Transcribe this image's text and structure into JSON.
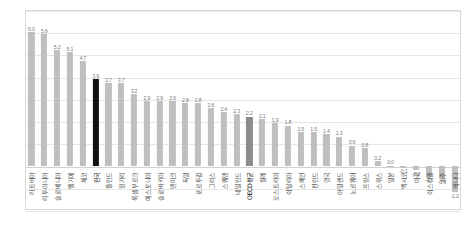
{
  "chart_data": {
    "type": "bar",
    "title": "",
    "subtitle": "",
    "xlabel": "",
    "ylabel": "",
    "ylim": [
      -2.0,
      7.0
    ],
    "ytick_step": 1.0,
    "ytick_labels": [
      "7.0",
      "6.0",
      "5.0",
      "4.0",
      "3.0",
      "2.0",
      "1.0",
      "0.0",
      "-1.0",
      "-2.0"
    ],
    "ytick_values": [
      7.0,
      6.0,
      5.0,
      4.0,
      3.0,
      2.0,
      1.0,
      0.0,
      -1.0,
      -2.0
    ],
    "grid": true,
    "grid_axis": "y",
    "legend": "none",
    "bar_color": "#bfbfbf",
    "highlight_color": "#111111",
    "average_color": "#8c8c8c",
    "categories": [
      "라트비아",
      "리투아니아",
      "슬로베니아",
      "벨기에",
      "체코",
      "한국",
      "폴란드",
      "헝가리",
      "룩셈부르크",
      "에스토니아",
      "슬로바키아",
      "덴마크",
      "독일",
      "포르투갈",
      "그리스",
      "스웨덴",
      "네덜란드",
      "OECD평균",
      "칠레",
      "오스트리아",
      "이탈리아",
      "스페인",
      "핀란드",
      "영국",
      "아일랜드",
      "노르웨이",
      "프랑스",
      "스위스",
      "일본",
      "멕시코",
      "미국",
      "이스라엘",
      "호주",
      "캐나다"
    ],
    "values": [
      6.0,
      5.9,
      5.2,
      5.1,
      4.7,
      3.9,
      3.7,
      3.7,
      3.2,
      2.9,
      2.9,
      2.9,
      2.8,
      2.8,
      2.6,
      2.4,
      2.3,
      2.2,
      2.1,
      1.9,
      1.8,
      1.5,
      1.5,
      1.4,
      1.3,
      0.9,
      0.8,
      0.2,
      0.0,
      -0.1,
      -0.2,
      -0.5,
      -0.6,
      -1.2
    ],
    "value_labels": [
      "6.0",
      "5.9",
      "5.2",
      "5.1",
      "4.7",
      "3.9",
      "3.7",
      "3.7",
      "3.2",
      "2.9",
      "2.9",
      "2.9",
      "2.8",
      "2.8",
      "2.6",
      "2.4",
      "2.3",
      "2.2",
      "2.1",
      "1.9",
      "1.8",
      "1.5",
      "1.5",
      "1.4",
      "1.3",
      "0.9",
      "0.8",
      "0.2",
      "0.0",
      "-0.1",
      "-0.2",
      "-0.5",
      "-0.6",
      "-1.2"
    ],
    "highlight_index": 5,
    "average_index": 17
  }
}
